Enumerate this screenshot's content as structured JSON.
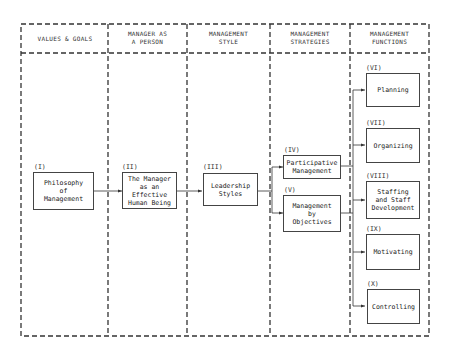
{
  "diagram": {
    "columns": [
      {
        "header": "VALUES & GOALS"
      },
      {
        "header": "MANAGER AS\nA PERSON"
      },
      {
        "header": "MANAGEMENT\nSTYLE"
      },
      {
        "header": "MANAGEMENT\nSTRATEGIES"
      },
      {
        "header": "MANAGEMENT\nFUNCTIONS"
      }
    ],
    "nodes": [
      {
        "id": "I",
        "number": "(I)",
        "label": "Philosophy\nof\nManagement",
        "column": 0
      },
      {
        "id": "II",
        "number": "(II)",
        "label": "The Manager\nas an\nEffective\nHuman Being",
        "column": 1
      },
      {
        "id": "III",
        "number": "(III)",
        "label": "Leadership\nStyles",
        "column": 2
      },
      {
        "id": "IV",
        "number": "(IV)",
        "label": "Participative\nManagement",
        "column": 3
      },
      {
        "id": "V",
        "number": "(V)",
        "label": "Management\nby\nObjectives",
        "column": 3
      },
      {
        "id": "VI",
        "number": "(VI)",
        "label": "Planning",
        "column": 4
      },
      {
        "id": "VII",
        "number": "(VII)",
        "label": "Organizing",
        "column": 4
      },
      {
        "id": "VIII",
        "number": "(VIII)",
        "label": "Staffing\nand Staff\nDevelopment",
        "column": 4
      },
      {
        "id": "IX",
        "number": "(IX)",
        "label": "Motivating",
        "column": 4
      },
      {
        "id": "X",
        "number": "(X)",
        "label": "Controlling",
        "column": 4
      }
    ],
    "edges": [
      {
        "from": "I",
        "to": "II"
      },
      {
        "from": "II",
        "to": "III"
      },
      {
        "from": "III",
        "to": "IV"
      },
      {
        "from": "III",
        "to": "V"
      },
      {
        "from": "IV",
        "to": "VI"
      },
      {
        "from": "IV",
        "to": "VII"
      },
      {
        "from": "IV",
        "to": "VIII"
      },
      {
        "from": "IV",
        "to": "IX"
      },
      {
        "from": "IV",
        "to": "X"
      },
      {
        "from": "V",
        "to": "VI"
      },
      {
        "from": "V",
        "to": "VII"
      },
      {
        "from": "V",
        "to": "VIII"
      },
      {
        "from": "V",
        "to": "IX"
      },
      {
        "from": "V",
        "to": "X"
      }
    ],
    "colors": {
      "line": "#333333",
      "background": "#ffffff"
    }
  }
}
